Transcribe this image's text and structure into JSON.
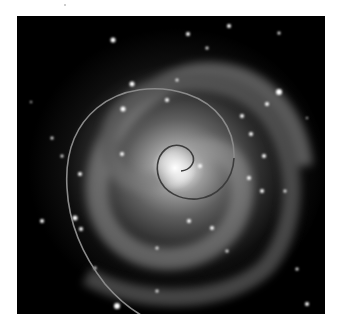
{
  "figure": {
    "background_color": "#000000",
    "page_color": "#ffffff",
    "galaxy_core_color": "#f4f4f4",
    "spiral_overlay_color": "#8a8a8a",
    "spiral_inner_color": "#3c3c3c"
  }
}
